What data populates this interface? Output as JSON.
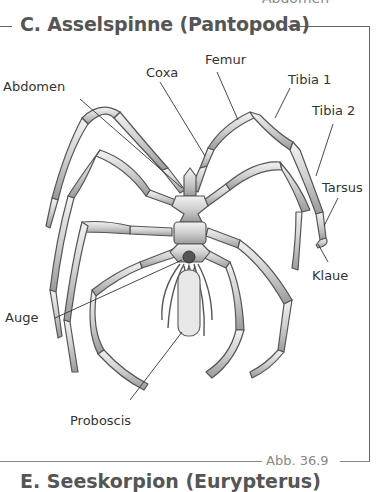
{
  "header": {
    "cut_off_text": "Abdomen",
    "title": "C. Asselspinne (Pantopoda)"
  },
  "labels": {
    "coxa": "Coxa",
    "femur": "Femur",
    "tibia1": "Tibia 1",
    "tibia2": "Tibia 2",
    "abdomen": "Abdomen",
    "tarsus": "Tarsus",
    "klaue": "Klaue",
    "auge": "Auge",
    "proboscis": "Proboscis"
  },
  "footer": {
    "figure_number": "Abb. 36.9",
    "next_section_title": "E. Seeskorpion (Eurypterus)"
  },
  "colors": {
    "leg_fill": "#d4d4d4",
    "leg_stroke": "#555555",
    "frame_line": "#666666",
    "title_text": "#555555"
  }
}
